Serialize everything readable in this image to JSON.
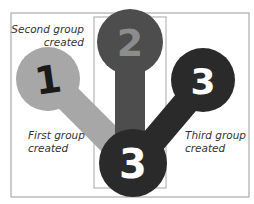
{
  "diagram": {
    "type": "grouping-illustration",
    "colors": {
      "frame": "#9a9a9a",
      "highlight_box": "#a8a8a8",
      "group1": "#a7a7a7",
      "group2": "#4d4d4d",
      "group3": "#2a2a2a",
      "group1_number": "#1a1a1a",
      "group2_number": "#8c8c8c",
      "group3_number": "#ffffff"
    },
    "groups": [
      {
        "id": "1",
        "number": "1",
        "label_lines": [
          "First group",
          "created"
        ]
      },
      {
        "id": "2",
        "number": "2",
        "label_lines": [
          "Second group",
          "created"
        ]
      },
      {
        "id": "3",
        "number": "3",
        "label_lines": [
          "Third group",
          "created"
        ]
      }
    ]
  }
}
